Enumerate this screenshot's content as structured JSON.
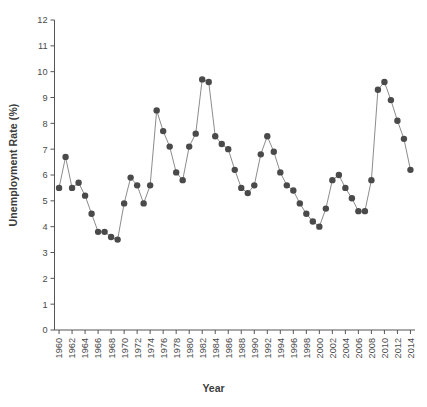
{
  "chart_data": {
    "type": "line",
    "title": "",
    "xlabel": "Year",
    "ylabel": "Unemployment Rate (%)",
    "xlim": [
      1959.3,
      2014.7
    ],
    "ylim": [
      0,
      12
    ],
    "yticks": [
      0,
      1,
      2,
      3,
      4,
      5,
      6,
      7,
      8,
      9,
      10,
      11,
      12
    ],
    "ytick_labels": [
      "0",
      "1",
      "2",
      "3",
      "4",
      "5",
      "6",
      "7",
      "8",
      "9",
      "10",
      "11",
      "12"
    ],
    "xtick_labels": [
      "1960",
      "1962",
      "1964",
      "1966",
      "1968",
      "1970",
      "1972",
      "1974",
      "1976",
      "1978",
      "1980",
      "1982",
      "1984",
      "1986",
      "1988",
      "1990",
      "1992",
      "1994",
      "1996",
      "1998",
      "2000",
      "2002",
      "2004",
      "2006",
      "2008",
      "2010",
      "2012",
      "2014"
    ],
    "xtick_step": 2,
    "grid": false,
    "legend": "none",
    "marker": "circle-filled",
    "marker_color": "#4a4a4a",
    "line_color": "#8c8c8c",
    "x": [
      1960,
      1961,
      1962,
      1963,
      1964,
      1965,
      1966,
      1967,
      1968,
      1969,
      1970,
      1971,
      1972,
      1973,
      1974,
      1975,
      1976,
      1977,
      1978,
      1979,
      1980,
      1981,
      1982,
      1983,
      1984,
      1985,
      1986,
      1987,
      1988,
      1989,
      1990,
      1991,
      1992,
      1993,
      1994,
      1995,
      1996,
      1997,
      1998,
      1999,
      2000,
      2001,
      2002,
      2003,
      2004,
      2005,
      2006,
      2007,
      2008,
      2009,
      2010,
      2011,
      2012,
      2013,
      2014
    ],
    "values": [
      5.5,
      6.7,
      5.5,
      5.7,
      5.2,
      4.5,
      3.8,
      3.8,
      3.6,
      3.5,
      4.9,
      5.9,
      5.6,
      4.9,
      5.6,
      8.5,
      7.7,
      7.1,
      6.1,
      5.8,
      7.1,
      7.6,
      9.7,
      9.6,
      7.5,
      7.2,
      7.0,
      6.2,
      5.5,
      5.3,
      5.6,
      6.8,
      7.5,
      6.9,
      6.1,
      5.6,
      5.4,
      4.9,
      4.5,
      4.2,
      4.0,
      4.7,
      5.8,
      6.0,
      5.5,
      5.1,
      4.6,
      4.6,
      5.8,
      9.3,
      9.6,
      8.9,
      8.1,
      7.4,
      6.2
    ],
    "series_name": "Unemployment Rate"
  }
}
